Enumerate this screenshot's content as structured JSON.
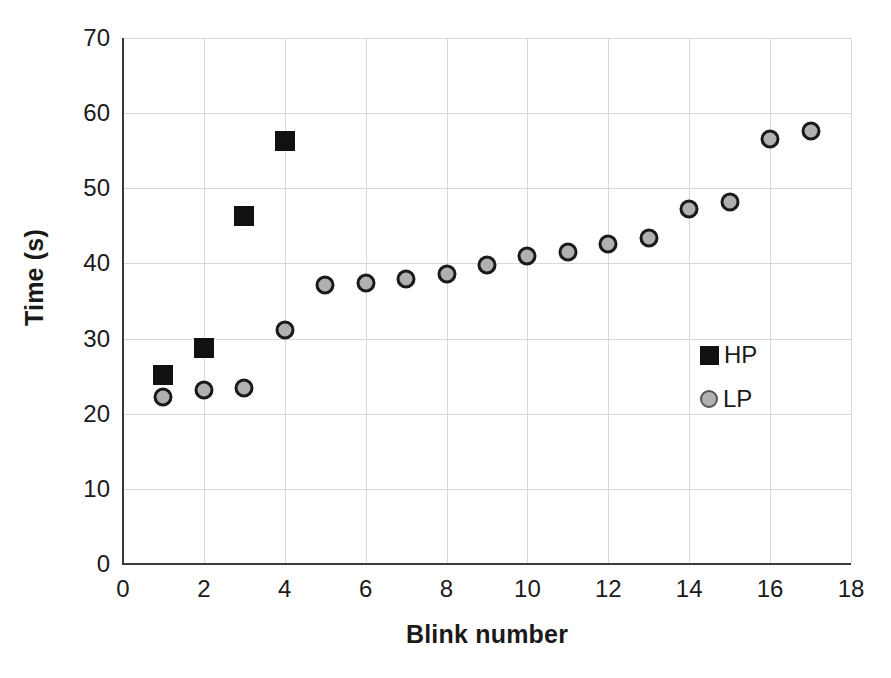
{
  "chart_data": {
    "type": "scatter",
    "title": "",
    "xlabel": "Blink number",
    "ylabel": "Time (s)",
    "xlim": [
      0,
      18
    ],
    "ylim": [
      0,
      70
    ],
    "xticks": [
      0,
      2,
      4,
      6,
      8,
      10,
      12,
      14,
      16,
      18
    ],
    "yticks": [
      0,
      10,
      20,
      30,
      40,
      50,
      60,
      70
    ],
    "grid": true,
    "legend_position": "inside-right",
    "series": [
      {
        "name": "HP",
        "marker": "square",
        "color": "#111111",
        "x": [
          1,
          2,
          3,
          4
        ],
        "values": [
          25.2,
          28.7,
          46.3,
          56.3
        ]
      },
      {
        "name": "LP",
        "marker": "circle",
        "color": "#b0b0b0",
        "edge_color": "#1a1a1a",
        "x": [
          1,
          2,
          3,
          4,
          5,
          6,
          7,
          8,
          9,
          10,
          11,
          12,
          13,
          14,
          15,
          16,
          17
        ],
        "values": [
          22.2,
          23.2,
          23.4,
          31.2,
          37.1,
          37.4,
          37.9,
          38.6,
          39.8,
          41.0,
          41.5,
          42.6,
          43.4,
          47.2,
          48.2,
          56.5,
          57.6
        ]
      }
    ]
  },
  "legend": {
    "items": [
      {
        "label": "HP",
        "marker": "square-marker-icon"
      },
      {
        "label": "LP",
        "marker": "circle-marker-icon"
      }
    ]
  }
}
